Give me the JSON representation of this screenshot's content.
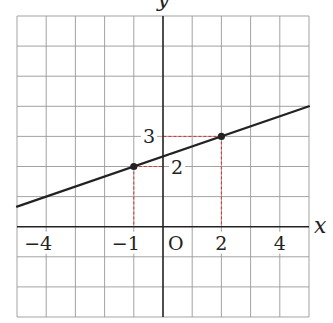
{
  "chart_data": {
    "type": "line",
    "title": "",
    "xlabel": "x",
    "ylabel": "y",
    "origin_label": "O",
    "xlim": [
      -5,
      5
    ],
    "ylim": [
      -3,
      7
    ],
    "grid": true,
    "x_tick_labels": [
      {
        "value": -4,
        "text": "−4"
      },
      {
        "value": -1,
        "text": "−1"
      },
      {
        "value": 2,
        "text": "2"
      },
      {
        "value": 4,
        "text": "4"
      }
    ],
    "y_tick_labels": [
      {
        "value": 3,
        "text": "3",
        "side": "left"
      },
      {
        "value": 2,
        "text": "2",
        "side": "right"
      }
    ],
    "series": [
      {
        "name": "line",
        "equation": "y = (1/3)x + 7/3",
        "x": [
          -5,
          5
        ],
        "y": [
          0.667,
          4.0
        ],
        "color": "#222222"
      }
    ],
    "points": [
      {
        "x": -1,
        "y": 2
      },
      {
        "x": 2,
        "y": 3
      }
    ],
    "guide_color": "#e03030",
    "grid_color": "#999999",
    "axis_color": "#222222"
  }
}
